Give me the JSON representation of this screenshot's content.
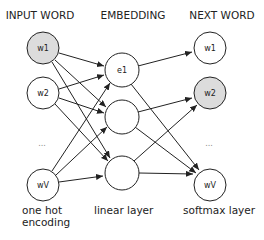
{
  "headers": {
    "input": "INPUT WORD",
    "embedding": "EMBEDDING",
    "output": "NEXT WORD"
  },
  "footers": {
    "input_line1": "one hot",
    "input_line2": "encoding",
    "embedding": "linear layer",
    "output": "softmax layer"
  },
  "input_layer": {
    "nodes": [
      {
        "label": "w1",
        "highlighted": true
      },
      {
        "label": "w2",
        "highlighted": false
      },
      {
        "label": "wV",
        "highlighted": false
      }
    ],
    "ellipsis": "..."
  },
  "embedding_layer": {
    "nodes": [
      {
        "label": "e1"
      },
      {
        "label": ""
      },
      {
        "label": ""
      }
    ]
  },
  "output_layer": {
    "nodes": [
      {
        "label": "w1",
        "highlighted": false
      },
      {
        "label": "w2",
        "highlighted": true
      },
      {
        "label": "wV",
        "highlighted": false
      }
    ],
    "ellipsis": "..."
  },
  "colors": {
    "highlight_fill": "#dcdcdc",
    "node_fill": "#ffffff",
    "stroke": "#222222"
  }
}
